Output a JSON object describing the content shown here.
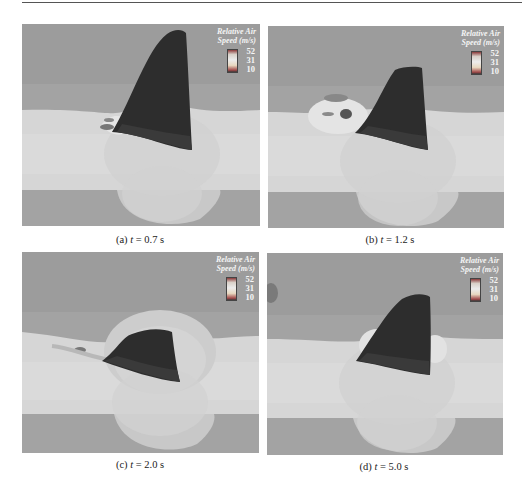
{
  "figure": {
    "legend": {
      "title_line1": "Relative Air",
      "title_line2": "Speed (m/s)",
      "ticks": [
        "52",
        "31",
        "10"
      ],
      "colors": {
        "high": "#8a3a3a",
        "mid": "#ececec",
        "low": "#a04848"
      }
    },
    "panels": [
      {
        "label": "(a)",
        "var": "t",
        "eq": " = 0.7 s"
      },
      {
        "label": "(b)",
        "var": "t",
        "eq": " = 1.2 s"
      },
      {
        "label": "(c)",
        "var": "t",
        "eq": " = 2.0 s"
      },
      {
        "label": "(d)",
        "var": "t",
        "eq": " = 5.0 s"
      }
    ],
    "colors": {
      "background_gray": "#a2a2a2",
      "band_light": "#d9d9d9",
      "sail_dark": "#2c2c2c"
    }
  }
}
